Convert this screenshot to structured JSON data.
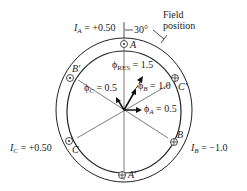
{
  "labels": {
    "ia": "I",
    "ia_sub": "A",
    "ia_val": " = +0.50",
    "angle": "30°",
    "field_line1": "Field",
    "field_line2": "position",
    "ib": "I",
    "ib_sub": "B",
    "ib_val": " = −1.0",
    "ic": "I",
    "ic_sub": "C",
    "ic_val": " = +0.50",
    "phi_res": "ϕ",
    "phi_res_sub": "RES",
    "phi_res_val": " = 1.5",
    "phi_a": "ϕ",
    "phi_a_sub": "A",
    "phi_a_val": " = 0.5",
    "phi_b": "ϕ",
    "phi_b_sub": "B",
    "phi_b_val": " = 1.0",
    "phi_c": "ϕ",
    "phi_c_sub": "C",
    "phi_c_val": " = 0.5",
    "coil_a": "A",
    "coil_a_prime": "A′",
    "coil_b": "B",
    "coil_b_prime": "B′",
    "coil_c": "C",
    "coil_c_prime": "C′"
  }
}
